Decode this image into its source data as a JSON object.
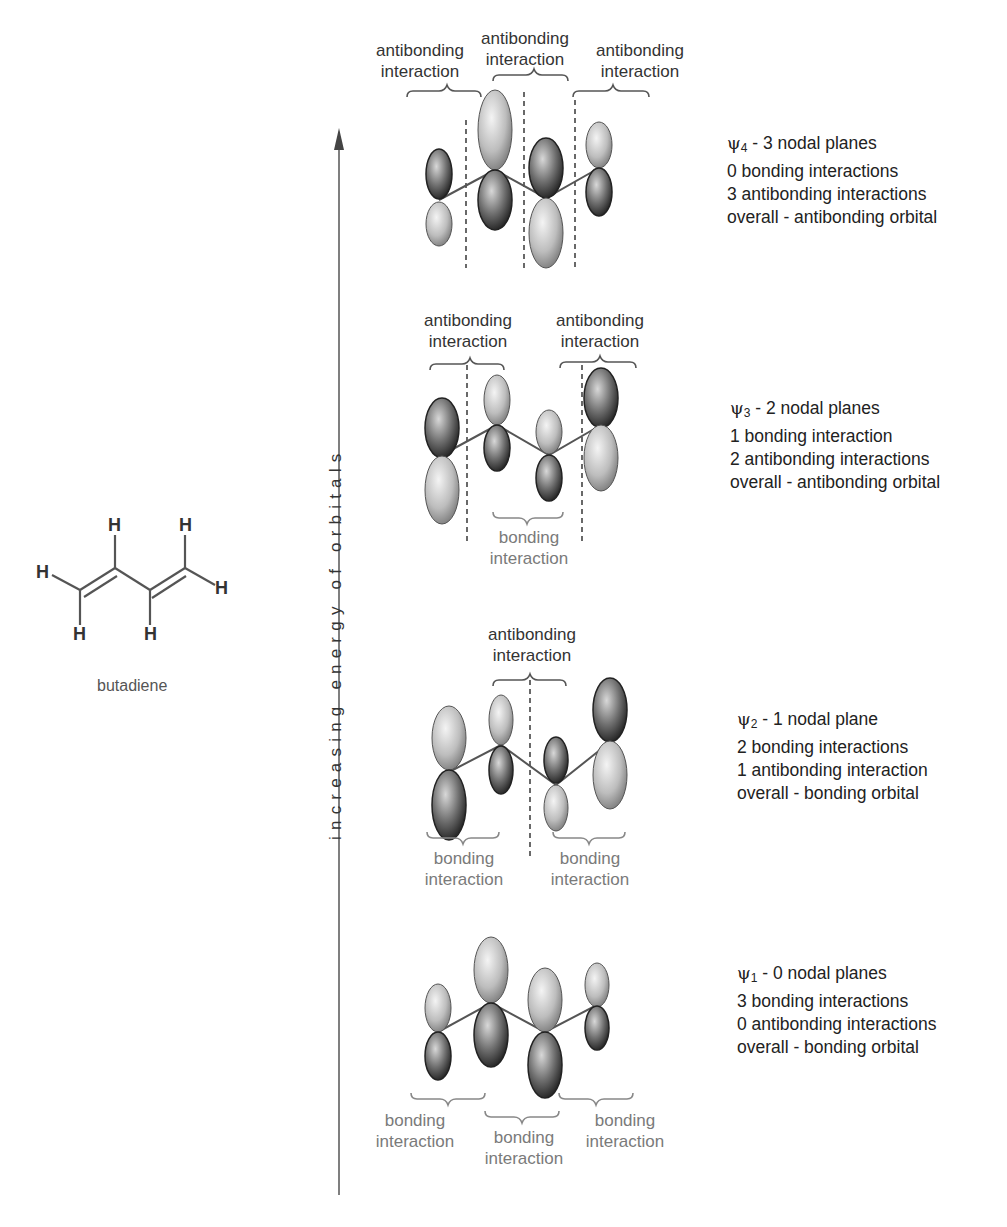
{
  "molecule": {
    "name": "butadiene",
    "atoms": [
      "H",
      "H",
      "H",
      "H",
      "H",
      "H"
    ],
    "colors": {
      "bond": "#555555"
    }
  },
  "axis": {
    "label": "increasing energy of orbitals",
    "direction": "up"
  },
  "colors": {
    "dark_text": "#333333",
    "grey_text": "#7a7a7a",
    "node_line": "#444444",
    "lobe_light": "#d6d6d6",
    "lobe_dark": "#3a3a3a"
  },
  "orbitals": [
    {
      "id": "psi4",
      "symbol": "ψ",
      "index": "4",
      "title_suffix": " - 3 nodal planes",
      "lines": [
        "0 bonding interactions",
        "3 antibonding interactions",
        "overall - antibonding orbital"
      ],
      "top_labels": [
        {
          "line1": "antibonding",
          "line2": "interaction"
        },
        {
          "line1": "antibonding",
          "line2": "interaction"
        },
        {
          "line1": "antibonding",
          "line2": "interaction"
        }
      ],
      "bottom_labels": []
    },
    {
      "id": "psi3",
      "symbol": "ψ",
      "index": "3",
      "title_suffix": " - 2 nodal planes",
      "lines": [
        "1 bonding interaction",
        "2 antibonding interactions",
        "overall - antibonding orbital"
      ],
      "top_labels": [
        {
          "line1": "antibonding",
          "line2": "interaction"
        },
        {
          "line1": "antibonding",
          "line2": "interaction"
        }
      ],
      "bottom_labels": [
        {
          "line1": "bonding",
          "line2": "interaction"
        }
      ]
    },
    {
      "id": "psi2",
      "symbol": "ψ",
      "index": "2",
      "title_suffix": " - 1 nodal plane",
      "lines": [
        "2 bonding interactions",
        "1 antibonding interaction",
        "overall - bonding orbital"
      ],
      "top_labels": [
        {
          "line1": "antibonding",
          "line2": "interaction"
        }
      ],
      "bottom_labels": [
        {
          "line1": "bonding",
          "line2": "interaction"
        },
        {
          "line1": "bonding",
          "line2": "interaction"
        }
      ]
    },
    {
      "id": "psi1",
      "symbol": "ψ",
      "index": "1",
      "title_suffix": " - 0 nodal planes",
      "lines": [
        "3 bonding interactions",
        "0 antibonding interactions",
        "overall - bonding orbital"
      ],
      "top_labels": [],
      "bottom_labels": [
        {
          "line1": "bonding",
          "line2": "interaction"
        },
        {
          "line1": "bonding",
          "line2": "interaction"
        },
        {
          "line1": "bonding",
          "line2": "interaction"
        }
      ]
    }
  ]
}
